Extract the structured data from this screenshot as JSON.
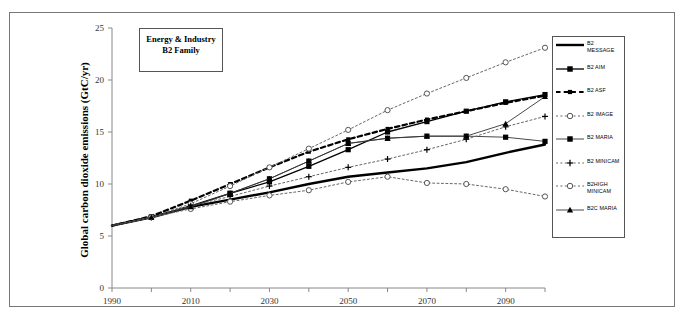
{
  "figure": {
    "callout": {
      "line1": "Energy & Industry",
      "line2": "B2 Family"
    },
    "ylabel": "Global carbon dioxide emissions (GtC/yr)"
  },
  "chart_data": {
    "type": "line",
    "title": "Energy & Industry  B2 Family",
    "xlabel": "",
    "ylabel": "Global carbon dioxide emissions (GtC/yr)",
    "xlim": [
      1990,
      2100
    ],
    "ylim": [
      0,
      25
    ],
    "xticks": [
      1990,
      2010,
      2030,
      2050,
      2070,
      2090
    ],
    "xtick_labels": [
      "1990",
      "2010",
      "2030",
      "2050",
      "2070",
      "2090"
    ],
    "yticks": [
      0,
      5,
      10,
      15,
      20,
      25
    ],
    "ytick_labels": [
      "0",
      "5",
      "10",
      "15",
      "20",
      "25"
    ],
    "grid": false,
    "legend_position": "right",
    "x": [
      1990,
      2000,
      2010,
      2020,
      2030,
      2040,
      2050,
      2060,
      2070,
      2080,
      2090,
      2100
    ],
    "series": [
      {
        "name": "B2 MESSAGE",
        "style": "solid-thick",
        "marker": "none",
        "values": [
          6.0,
          6.8,
          7.8,
          8.5,
          9.2,
          10.0,
          10.7,
          11.1,
          11.5,
          12.1,
          13.0,
          13.8
        ]
      },
      {
        "name": "B2 AIM",
        "style": "solid",
        "marker": "square",
        "values": [
          6.0,
          6.8,
          7.9,
          9.1,
          10.2,
          11.7,
          13.3,
          15.0,
          16.0,
          17.0,
          17.9,
          18.6
        ]
      },
      {
        "name": "B2 ASF",
        "style": "dashed-thick",
        "marker": "square-small",
        "values": [
          6.0,
          6.9,
          8.4,
          10.0,
          11.6,
          13.1,
          14.3,
          15.3,
          16.2,
          17.0,
          17.8,
          18.5
        ]
      },
      {
        "name": "B2 IMAGE",
        "style": "dotted",
        "marker": "circle-open",
        "values": [
          6.0,
          6.8,
          8.1,
          9.8,
          11.6,
          13.4,
          15.2,
          17.1,
          18.7,
          20.2,
          21.7,
          23.1
        ]
      },
      {
        "name": "B2 MARIA",
        "style": "solid-thin",
        "marker": "square",
        "values": [
          6.0,
          6.8,
          7.8,
          9.1,
          10.5,
          12.2,
          13.9,
          14.4,
          14.6,
          14.6,
          14.5,
          14.1
        ]
      },
      {
        "name": "B2 MINICAM",
        "style": "dotted",
        "marker": "plus",
        "values": [
          6.0,
          6.8,
          7.9,
          8.8,
          9.8,
          10.7,
          11.6,
          12.4,
          13.3,
          14.3,
          15.5,
          16.5
        ]
      },
      {
        "name": "B2HIGH MINICAM",
        "style": "dotted",
        "marker": "circle-open",
        "values": [
          6.0,
          6.8,
          7.6,
          8.3,
          8.9,
          9.4,
          10.2,
          10.7,
          10.1,
          10.0,
          9.5,
          8.8
        ]
      },
      {
        "name": "B2C MARIA",
        "style": "solid-thin",
        "marker": "triangle",
        "values": [
          6.0,
          6.8,
          7.8,
          9.1,
          10.5,
          12.2,
          13.9,
          14.4,
          14.6,
          14.6,
          15.8,
          18.4
        ]
      }
    ]
  },
  "legend": {
    "items": [
      {
        "label": "B2\nMESSAGE",
        "label_l1": "B2",
        "label_l2": "MESSAGE"
      },
      {
        "label": "B2 AIM",
        "label_l1": "B2 AIM",
        "label_l2": ""
      },
      {
        "label": "B2 ASF",
        "label_l1": "B2 ASF",
        "label_l2": ""
      },
      {
        "label": "B2 IMAGE",
        "label_l1": "B2 IMAGE",
        "label_l2": ""
      },
      {
        "label": "B2 MARIA",
        "label_l1": "B2 MARIA",
        "label_l2": ""
      },
      {
        "label": "B2 MINICAM",
        "label_l1": "B2 MINICAM",
        "label_l2": ""
      },
      {
        "label": "B2HIGH MINICAM",
        "label_l1": "B2HIGH",
        "label_l2": "MINICAM"
      },
      {
        "label": "B2C MARIA",
        "label_l1": "B2C MARIA",
        "label_l2": ""
      }
    ]
  }
}
